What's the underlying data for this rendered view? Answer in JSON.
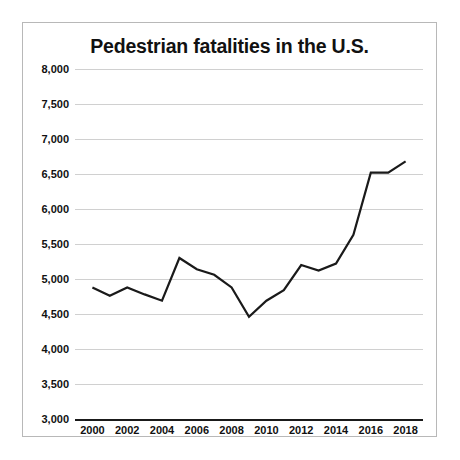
{
  "chart_data": {
    "type": "line",
    "title": "Pedestrian fatalities in the U.S.",
    "xlabel": "",
    "ylabel": "",
    "ylim": [
      3000,
      8000
    ],
    "xlim": [
      1999,
      2019
    ],
    "grid": true,
    "legend": false,
    "y_ticks": [
      3000,
      3500,
      4000,
      4500,
      5000,
      5500,
      6000,
      6500,
      7000,
      7500,
      8000
    ],
    "y_tick_labels": [
      "3,000",
      "3,500",
      "4,000",
      "4,500",
      "5,000",
      "5,500",
      "6,000",
      "6,500",
      "7,000",
      "7,500",
      "8,000"
    ],
    "x_ticks": [
      2000,
      2002,
      2004,
      2006,
      2008,
      2010,
      2012,
      2014,
      2016,
      2018
    ],
    "x_tick_labels": [
      "2000",
      "2002",
      "2004",
      "2006",
      "2008",
      "2010",
      "2012",
      "2014",
      "2016",
      "2018"
    ],
    "x": [
      2000,
      2001,
      2002,
      2003,
      2004,
      2005,
      2006,
      2007,
      2008,
      2009,
      2010,
      2011,
      2012,
      2013,
      2014,
      2015,
      2016,
      2017,
      2018
    ],
    "values": [
      4880,
      4760,
      4880,
      4780,
      4690,
      5300,
      5140,
      5060,
      4880,
      4460,
      4690,
      4840,
      5200,
      5120,
      5220,
      5630,
      6520,
      6520,
      6680
    ],
    "series": [
      {
        "name": "Pedestrian fatalities",
        "color": "#1a1a1a",
        "values": [
          4880,
          4760,
          4880,
          4780,
          4690,
          5300,
          5140,
          5060,
          4880,
          4460,
          4690,
          4840,
          5200,
          5120,
          5220,
          5630,
          6520,
          6520,
          6680
        ]
      }
    ],
    "colors": {
      "line": "#1a1a1a",
      "grid": "#d0d0d0",
      "axis": "#1a1a1a",
      "border": "#b8b8b8",
      "background": "#ffffff",
      "text": "#111111"
    }
  }
}
